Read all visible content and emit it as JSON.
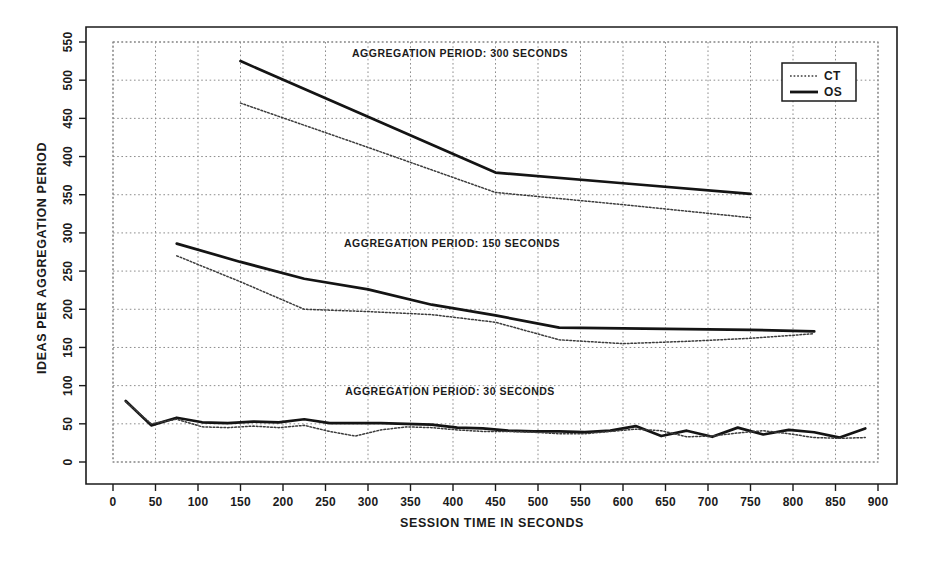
{
  "chart_data": {
    "type": "line",
    "title": "",
    "xlabel": "SESSION TIME IN SECONDS",
    "ylabel": "IDEAS PER AGGREGATION PERIOD",
    "xlim": [
      0,
      900
    ],
    "ylim": [
      0,
      550
    ],
    "xticks": [
      0,
      50,
      100,
      150,
      200,
      250,
      300,
      350,
      400,
      450,
      500,
      550,
      600,
      650,
      700,
      750,
      800,
      850,
      900
    ],
    "yticks": [
      0,
      50,
      100,
      150,
      200,
      250,
      300,
      350,
      400,
      450,
      500,
      550
    ],
    "grid": true,
    "legend_position": "top-right",
    "legend": [
      {
        "name": "CT",
        "style": "dotted"
      },
      {
        "name": "OS",
        "style": "solid"
      }
    ],
    "annotations": [
      {
        "text": "AGGREGATION PERIOD: 300 SECONDS",
        "x": 460,
        "y": 535
      },
      {
        "text": "AGGREGATION PERIOD: 150 SECONDS",
        "x": 460,
        "y": 292
      },
      {
        "text": "AGGREGATION PERIOD: 30 SECONDS",
        "x": 460,
        "y": 82
      }
    ],
    "panels": [
      {
        "label": "AGGREGATION PERIOD: 300 SECONDS",
        "series": [
          {
            "name": "OS",
            "style": "solid",
            "x": [
              150,
              300,
              450,
              600,
              750
            ],
            "y": [
              525,
              452,
              379,
              365,
              351
            ]
          },
          {
            "name": "CT",
            "style": "dotted",
            "x": [
              150,
              300,
              450,
              600,
              750
            ],
            "y": [
              470,
              412,
              353,
              337,
              320
            ]
          }
        ]
      },
      {
        "label": "AGGREGATION PERIOD: 150 SECONDS",
        "series": [
          {
            "name": "OS",
            "style": "solid",
            "x": [
              75,
              150,
              225,
              300,
              375,
              450,
              525,
              600,
              675,
              750,
              825
            ],
            "y": [
              286,
              262,
              240,
              226,
              206,
              192,
              176,
              175,
              174,
              173,
              171
            ]
          },
          {
            "name": "CT",
            "style": "dotted",
            "x": [
              75,
              150,
              225,
              300,
              375,
              450,
              525,
              600,
              675,
              750,
              825
            ],
            "y": [
              270,
              236,
              200,
              197,
              193,
              183,
              160,
              155,
              158,
              162,
              168
            ]
          }
        ]
      },
      {
        "label": "AGGREGATION PERIOD: 30 SECONDS",
        "series": [
          {
            "name": "OS",
            "style": "solid",
            "x": [
              15,
              45,
              75,
              105,
              135,
              165,
              195,
              225,
              255,
              285,
              315,
              345,
              375,
              405,
              435,
              465,
              495,
              525,
              555,
              585,
              615,
              645,
              675,
              705,
              735,
              765,
              795,
              825,
              855,
              885
            ],
            "y": [
              80,
              48,
              58,
              52,
              51,
              53,
              52,
              56,
              51,
              51,
              51,
              50,
              49,
              45,
              44,
              41,
              40,
              40,
              39,
              41,
              47,
              34,
              41,
              33,
              45,
              36,
              42,
              39,
              32,
              44
            ]
          },
          {
            "name": "CT",
            "style": "dotted",
            "x": [
              15,
              45,
              75,
              105,
              135,
              165,
              195,
              225,
              255,
              285,
              315,
              345,
              375,
              405,
              435,
              465,
              495,
              525,
              555,
              585,
              615,
              645,
              675,
              705,
              735,
              765,
              795,
              825,
              855,
              885
            ],
            "y": [
              79,
              50,
              56,
              46,
              45,
              47,
              45,
              48,
              40,
              34,
              42,
              46,
              45,
              42,
              40,
              40,
              39,
              37,
              37,
              40,
              43,
              41,
              33,
              34,
              38,
              41,
              37,
              32,
              31,
              32
            ]
          }
        ]
      }
    ]
  },
  "axes": {
    "x_title": "SESSION TIME IN SECONDS",
    "y_title": "IDEAS PER AGGREGATION PERIOD",
    "x_tick_labels": [
      "0",
      "50",
      "100",
      "150",
      "200",
      "250",
      "300",
      "350",
      "400",
      "450",
      "500",
      "550",
      "600",
      "650",
      "700",
      "750",
      "800",
      "850",
      "900"
    ],
    "y_tick_labels": [
      "0",
      "50",
      "100",
      "150",
      "200",
      "250",
      "300",
      "350",
      "400",
      "450",
      "500",
      "550"
    ]
  },
  "legend": {
    "entry_ct": "CT",
    "entry_os": "OS"
  },
  "annotations": {
    "panel_300": "AGGREGATION PERIOD: 300 SECONDS",
    "panel_150": "AGGREGATION PERIOD: 150 SECONDS",
    "panel_30": "AGGREGATION PERIOD: 30 SECONDS"
  },
  "colors": {
    "ink": "#1b1b1b",
    "solid_series": "#141414",
    "dotted_series": "#3c3c3c",
    "grid": "#8d8d8d",
    "background": "#ffffff"
  }
}
